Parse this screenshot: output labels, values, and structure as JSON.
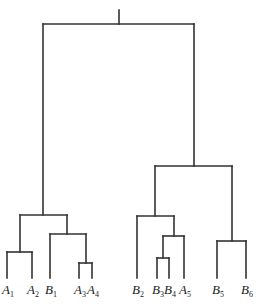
{
  "diagram": {
    "type": "dendrogram",
    "line_color": "#333333",
    "label_color": "#222222",
    "leaves": [
      {
        "letter": "A",
        "sub": "1",
        "x": 7
      },
      {
        "letter": "A",
        "sub": "2",
        "x": 32
      },
      {
        "letter": "B",
        "sub": "1",
        "x": 50
      },
      {
        "letter": "A",
        "sub": "3",
        "x": 79
      },
      {
        "letter": "A",
        "sub": "4",
        "x": 92
      },
      {
        "letter": "B",
        "sub": "2",
        "x": 137
      },
      {
        "letter": "B",
        "sub": "3",
        "x": 157
      },
      {
        "letter": "B",
        "sub": "4",
        "x": 169
      },
      {
        "letter": "A",
        "sub": "5",
        "x": 184
      },
      {
        "letter": "B",
        "sub": "5",
        "x": 217
      },
      {
        "letter": "B",
        "sub": "6",
        "x": 246
      }
    ],
    "merges": [
      {
        "name": "A1-A2",
        "x1": 7,
        "x2": 32,
        "y": 252,
        "children_y": [
          278,
          278
        ]
      },
      {
        "name": "A3-A4",
        "x1": 79,
        "x2": 92,
        "y": 263,
        "children_y": [
          278,
          278
        ]
      },
      {
        "name": "B1-(A3,A4)",
        "x1": 50,
        "x2": 86,
        "y": 234,
        "children_y": [
          278,
          263
        ]
      },
      {
        "name": "(A1,A2)-(B1,A3,A4)",
        "x1": 20,
        "x2": 67,
        "y": 215,
        "children_y": [
          252,
          234
        ]
      },
      {
        "name": "B3-B4",
        "x1": 157,
        "x2": 169,
        "y": 258,
        "children_y": [
          278,
          278
        ]
      },
      {
        "name": "(B3,B4)-A5",
        "x1": 163,
        "x2": 184,
        "y": 236,
        "children_y": [
          258,
          278
        ]
      },
      {
        "name": "B2-(B3,B4,A5)",
        "x1": 137,
        "x2": 174,
        "y": 216,
        "children_y": [
          278,
          236
        ]
      },
      {
        "name": "B5-B6",
        "x1": 217,
        "x2": 246,
        "y": 241,
        "children_y": [
          278,
          278
        ]
      },
      {
        "name": "(B2..A5)-(B5,B6)",
        "x1": 155,
        "x2": 232,
        "y": 166,
        "children_y": [
          216,
          241
        ]
      },
      {
        "name": "root",
        "x1": 43,
        "x2": 194,
        "y": 24,
        "children_y": [
          215,
          166
        ]
      }
    ],
    "root_stem": {
      "x": 119,
      "y_top": 10,
      "y_bottom": 24
    },
    "label_y": 294
  }
}
